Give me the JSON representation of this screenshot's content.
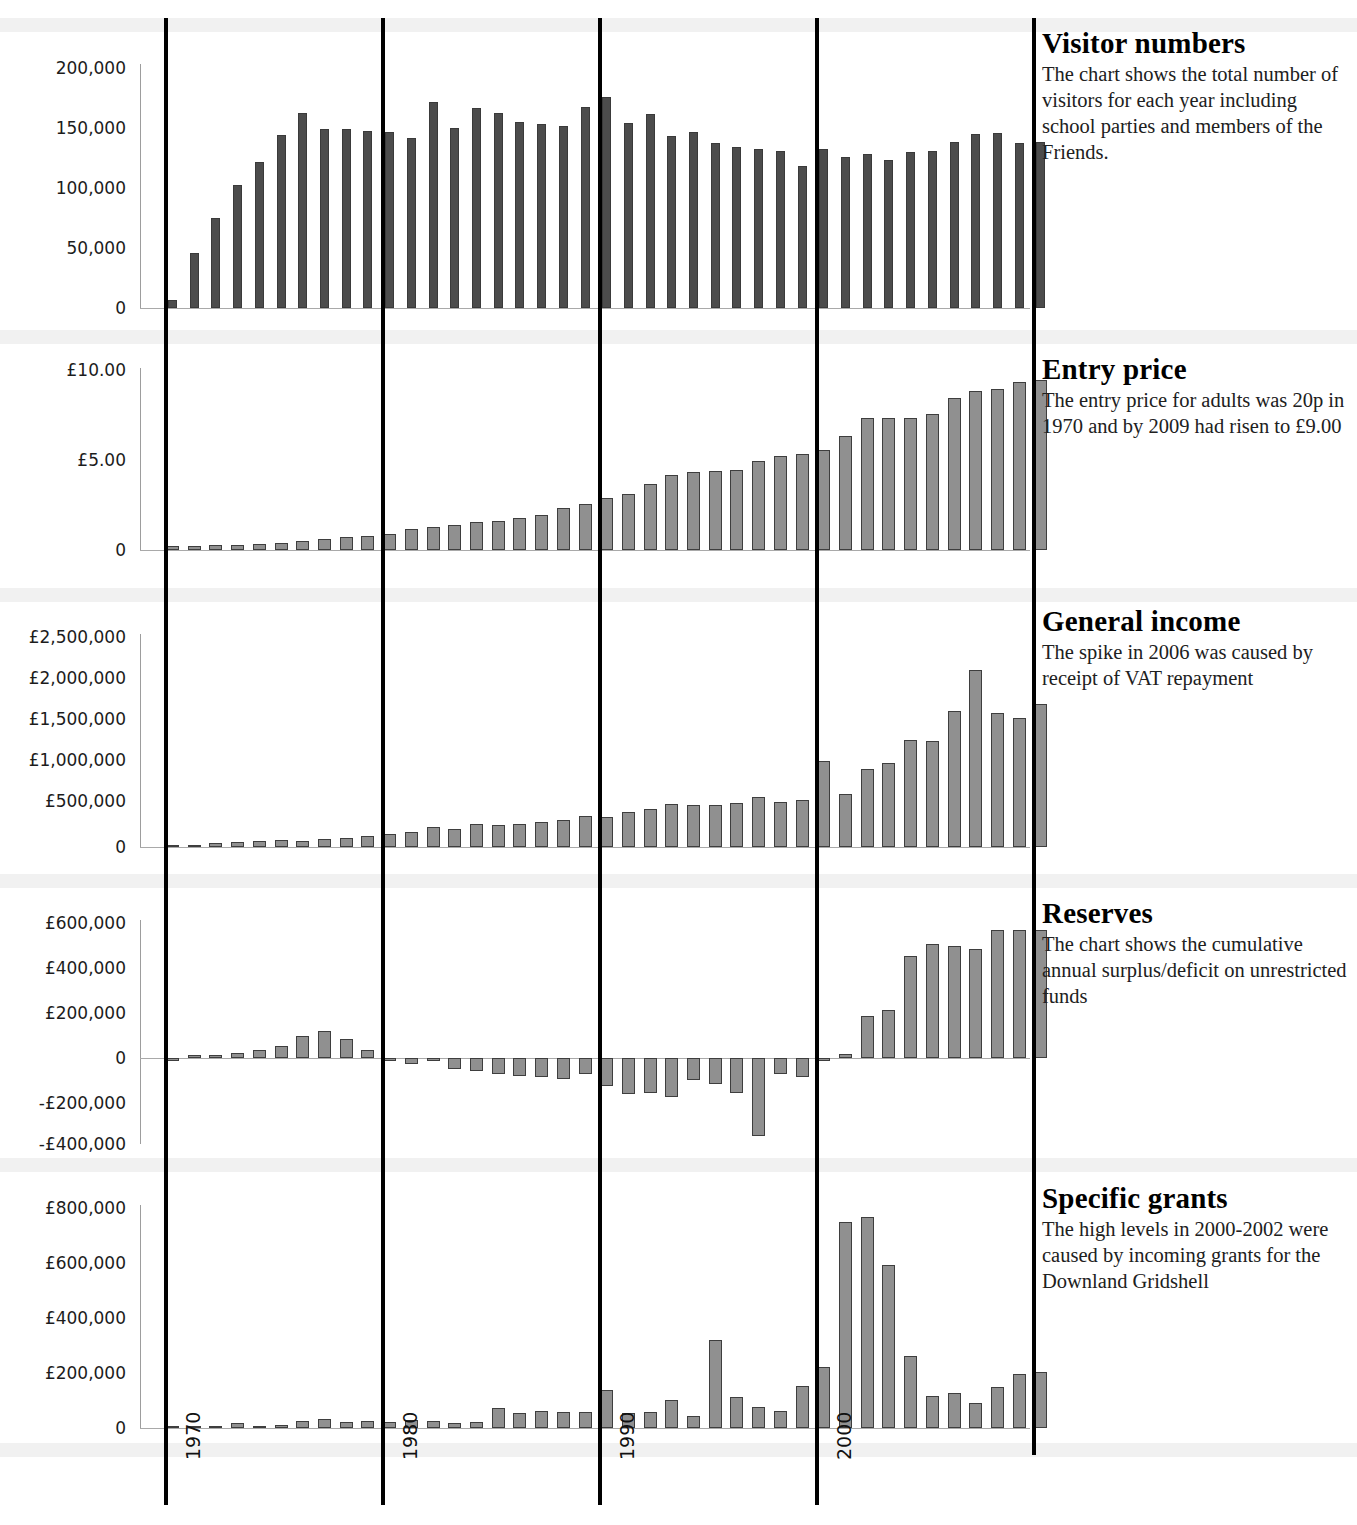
{
  "meta": {
    "decade_labels": [
      "1970",
      "1980",
      "1990",
      "2000"
    ],
    "bar_color_dark": "#4c4c4c",
    "bar_color_gray": "#909090",
    "rule_color": "#000000"
  },
  "panels": [
    {
      "key": "visitor_numbers",
      "title": "Visitor numbers",
      "description": "The chart shows the total number of visitors for each year including school parties and members of the Friends.",
      "ticks": [
        "200,000",
        "150,000",
        "100,000",
        "50,000",
        "0"
      ]
    },
    {
      "key": "entry_price",
      "title": "Entry price",
      "description": "The entry price for adults was 20p in 1970 and by 2009 had risen to £9.00",
      "ticks": [
        "£10.00",
        "£5.00",
        "0"
      ]
    },
    {
      "key": "general_income",
      "title": "General income",
      "description": "The spike in 2006 was caused by receipt of VAT repayment",
      "ticks": [
        "£2,500,000",
        "£2,000,000",
        "£1,500,000",
        "£1,000,000",
        "£500,000",
        "0"
      ]
    },
    {
      "key": "reserves",
      "title": "Reserves",
      "description": "The chart shows the cumulative annual surplus/deficit on unrestricted funds",
      "ticks": [
        "£600,000",
        "£400,000",
        "£200,000",
        "0",
        "-£200,000",
        "-£400,000"
      ]
    },
    {
      "key": "specific_grants",
      "title": "Specific grants",
      "description": "The high levels in 2000-2002 were caused by incoming grants for the Downland Gridshell",
      "ticks": [
        "£800,000",
        "£600,000",
        "£400,000",
        "£200,000",
        "0"
      ]
    }
  ],
  "chart_data": [
    {
      "type": "bar",
      "title": "Visitor numbers",
      "xlabel": "",
      "ylabel": "Visitors",
      "ylim": [
        0,
        220000
      ],
      "yticks": [
        0,
        50000,
        100000,
        150000,
        200000
      ],
      "grid": false,
      "x": [
        1970,
        1971,
        1972,
        1973,
        1974,
        1975,
        1976,
        1977,
        1978,
        1979,
        1980,
        1981,
        1982,
        1983,
        1984,
        1985,
        1986,
        1987,
        1988,
        1989,
        1990,
        1991,
        1992,
        1993,
        1994,
        1995,
        1996,
        1997,
        1998,
        1999,
        2000,
        2001,
        2002,
        2003,
        2004,
        2005,
        2006,
        2007,
        2008,
        2009
      ],
      "values": [
        7000,
        50000,
        81000,
        111000,
        132000,
        156000,
        176000,
        161000,
        161000,
        160000,
        159000,
        153000,
        186000,
        162000,
        180000,
        176000,
        168000,
        166000,
        164000,
        181000,
        190000,
        167000,
        175000,
        155000,
        159000,
        149000,
        145000,
        143000,
        142000,
        128000,
        143000,
        136000,
        139000,
        133000,
        141000,
        142000,
        150000,
        157000,
        158000,
        149000,
        150000
      ]
    },
    {
      "type": "bar",
      "title": "Entry price",
      "xlabel": "",
      "ylabel": "£",
      "ylim": [
        0,
        10
      ],
      "yticks": [
        0,
        5,
        10
      ],
      "grid": false,
      "x": [
        1970,
        1971,
        1972,
        1973,
        1974,
        1975,
        1976,
        1977,
        1978,
        1979,
        1980,
        1981,
        1982,
        1983,
        1984,
        1985,
        1986,
        1987,
        1988,
        1989,
        1990,
        1991,
        1992,
        1993,
        1994,
        1995,
        1996,
        1997,
        1998,
        1999,
        2000,
        2001,
        2002,
        2003,
        2004,
        2005,
        2006,
        2007,
        2008,
        2009
      ],
      "values": [
        0.2,
        0.2,
        0.25,
        0.3,
        0.35,
        0.4,
        0.5,
        0.6,
        0.7,
        0.75,
        0.9,
        1.15,
        1.25,
        1.35,
        1.55,
        1.6,
        1.75,
        1.95,
        2.3,
        2.55,
        2.85,
        3.1,
        3.65,
        4.1,
        4.3,
        4.35,
        4.4,
        4.9,
        5.15,
        5.25,
        5.5,
        6.25,
        7.25,
        7.25,
        7.25,
        7.5,
        8.35,
        8.75,
        8.85,
        9.25,
        9.35
      ]
    },
    {
      "type": "bar",
      "title": "General income",
      "xlabel": "",
      "ylabel": "£",
      "ylim": [
        0,
        2600000
      ],
      "yticks": [
        0,
        500000,
        1000000,
        1500000,
        2000000,
        2500000
      ],
      "grid": false,
      "x": [
        1970,
        1971,
        1972,
        1973,
        1974,
        1975,
        1976,
        1977,
        1978,
        1979,
        1980,
        1981,
        1982,
        1983,
        1984,
        1985,
        1986,
        1987,
        1988,
        1989,
        1990,
        1991,
        1992,
        1993,
        1994,
        1995,
        1996,
        1997,
        1998,
        1999,
        2000,
        2001,
        2002,
        2003,
        2004,
        2005,
        2006,
        2007,
        2008,
        2009
      ],
      "values": [
        12000,
        30000,
        45000,
        55000,
        75000,
        90000,
        75000,
        95000,
        115000,
        130000,
        155000,
        185000,
        245000,
        225000,
        275000,
        265000,
        275000,
        300000,
        330000,
        375000,
        370000,
        430000,
        460000,
        520000,
        515000,
        510000,
        535000,
        610000,
        545000,
        575000,
        1045000,
        650000,
        955000,
        1025000,
        1310000,
        1290000,
        1660000,
        2160000,
        1630000,
        1580000,
        1740000
      ]
    },
    {
      "type": "bar",
      "title": "Reserves",
      "xlabel": "",
      "ylabel": "£",
      "ylim": [
        -450000,
        620000
      ],
      "yticks": [
        -400000,
        -200000,
        0,
        200000,
        400000,
        600000
      ],
      "grid": false,
      "x": [
        1970,
        1971,
        1972,
        1973,
        1974,
        1975,
        1976,
        1977,
        1978,
        1979,
        1980,
        1981,
        1982,
        1983,
        1984,
        1985,
        1986,
        1987,
        1988,
        1989,
        1990,
        1991,
        1992,
        1993,
        1994,
        1995,
        1996,
        1997,
        1998,
        1999,
        2000,
        2001,
        2002,
        2003,
        2004,
        2005,
        2006,
        2007,
        2008,
        2009
      ],
      "values": [
        -5000,
        12000,
        14000,
        22000,
        38000,
        55000,
        100000,
        120000,
        85000,
        35000,
        -8000,
        -28000,
        -10000,
        -48000,
        -58000,
        -70000,
        -80000,
        -85000,
        -95000,
        -70000,
        -125000,
        -160000,
        -155000,
        -175000,
        -100000,
        -115000,
        -155000,
        -350000,
        -70000,
        -85000,
        -15000,
        20000,
        190000,
        215000,
        460000,
        510000,
        505000,
        490000,
        575000,
        575000,
        575000
      ]
    },
    {
      "type": "bar",
      "title": "Specific grants",
      "xlabel": "",
      "ylabel": "£",
      "ylim": [
        0,
        840000
      ],
      "yticks": [
        0,
        200000,
        400000,
        600000,
        800000
      ],
      "grid": false,
      "x": [
        1970,
        1971,
        1972,
        1973,
        1974,
        1975,
        1976,
        1977,
        1978,
        1979,
        1980,
        1981,
        1982,
        1983,
        1984,
        1985,
        1986,
        1987,
        1988,
        1989,
        1990,
        1991,
        1992,
        1993,
        1994,
        1995,
        1996,
        1997,
        1998,
        1999,
        2000,
        2001,
        2002,
        2003,
        2004,
        2005,
        2006,
        2007,
        2008,
        2009
      ],
      "values": [
        3000,
        9000,
        6000,
        20000,
        5000,
        10000,
        25000,
        35000,
        22000,
        28000,
        22000,
        30000,
        25000,
        18000,
        22000,
        75000,
        55000,
        65000,
        60000,
        62000,
        145000,
        55000,
        60000,
        105000,
        45000,
        330000,
        115000,
        80000,
        65000,
        160000,
        230000,
        775000,
        795000,
        615000,
        270000,
        120000,
        130000,
        95000,
        155000,
        205000,
        210000
      ]
    }
  ]
}
